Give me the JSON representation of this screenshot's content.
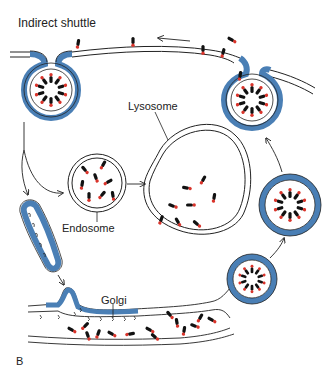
{
  "figure": {
    "title": "Indirect shuttle",
    "panel_letter": "B",
    "labels": {
      "lysosome": "Lysosome",
      "endosome": "Endosome",
      "golgi": "Golgi"
    },
    "colors": {
      "coat_blue": "#4a7fb5",
      "membrane": "#222222",
      "cargo_head": "#d9342b",
      "cargo_body": "#111111",
      "background": "#ffffff"
    },
    "structures": [
      "plasma-membrane",
      "coated-pit-left",
      "coated-pit-right",
      "coated-vesicle-right",
      "endosome",
      "lysosome",
      "tubular-coated-vesicle",
      "golgi-cisterna",
      "golgi-budding-vesicle"
    ],
    "arrows": [
      "surface-arrow-leftward",
      "pit-to-endosome",
      "pit-to-tubular-vesicle",
      "endosome-to-lysosome",
      "tubular-vesicle-to-golgi",
      "golgi-vesicle-to-coated-vesicle",
      "coated-vesicle-to-right-pit"
    ]
  }
}
